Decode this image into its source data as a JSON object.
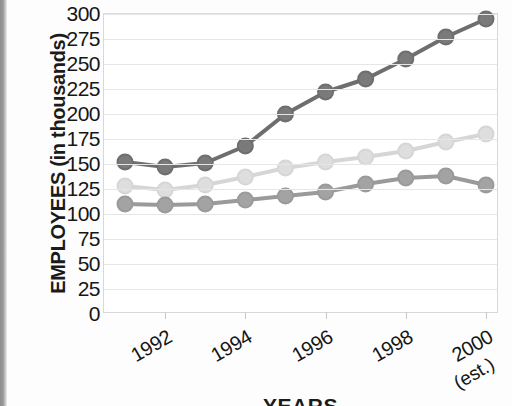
{
  "chart_data": {
    "type": "line",
    "title": "",
    "xlabel": "YEARS",
    "ylabel": "EMPLOYEES (in thousands)",
    "x": [
      1991,
      1992,
      1993,
      1994,
      1995,
      1996,
      1997,
      1998,
      1999,
      2000
    ],
    "xtick_labels": [
      "1992",
      "1994",
      "1996",
      "1998",
      "2000"
    ],
    "xtick_sublabel": "(est.)",
    "ytick_labels": [
      "300",
      "275",
      "250",
      "225",
      "200",
      "175",
      "150",
      "125",
      "100",
      "75",
      "50",
      "25",
      "0"
    ],
    "ylim": [
      0,
      300
    ],
    "ytick_step": 25,
    "grid": true,
    "legend": "none",
    "series": [
      {
        "name": "series-dark",
        "color": "#6e6e6e",
        "marker_color": "#7a7a7a",
        "values": [
          152,
          147,
          151,
          168,
          200,
          222,
          235,
          255,
          277,
          295
        ]
      },
      {
        "name": "series-light",
        "color": "#d6d6d6",
        "marker_color": "#dedede",
        "values": [
          128,
          124,
          129,
          137,
          146,
          152,
          157,
          163,
          172,
          180
        ]
      },
      {
        "name": "series-medium",
        "color": "#9a9a9a",
        "marker_color": "#a3a3a3",
        "values": [
          110,
          109,
          110,
          114,
          118,
          122,
          130,
          136,
          138,
          129
        ]
      }
    ]
  },
  "axis": {
    "y_title": "EMPLOYEES (in thousands)",
    "x_title": "YEARS"
  }
}
